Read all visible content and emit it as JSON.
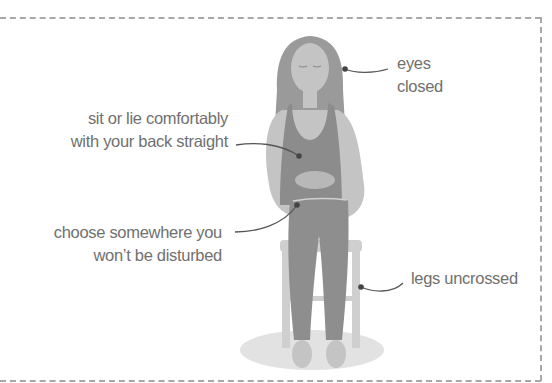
{
  "diagram": {
    "labels": {
      "eyes": {
        "line1": "eyes",
        "line2": "closed"
      },
      "back": {
        "line1": "sit or lie comfortably",
        "line2": "with your back straight"
      },
      "place": {
        "line1": "choose somewhere you",
        "line2": "won’t be disturbed"
      },
      "legs": {
        "line1": "legs uncrossed"
      }
    },
    "colors": {
      "text": "#707070",
      "leader": "#555555",
      "hair": "#9a9a9a",
      "skin": "#c4c4c4",
      "top": "#8c8c8c",
      "trousers": "#8e8e8e",
      "chair": "#cfcfcf",
      "shadow": "#e2e2e2",
      "border": "#a8a8a8"
    }
  }
}
